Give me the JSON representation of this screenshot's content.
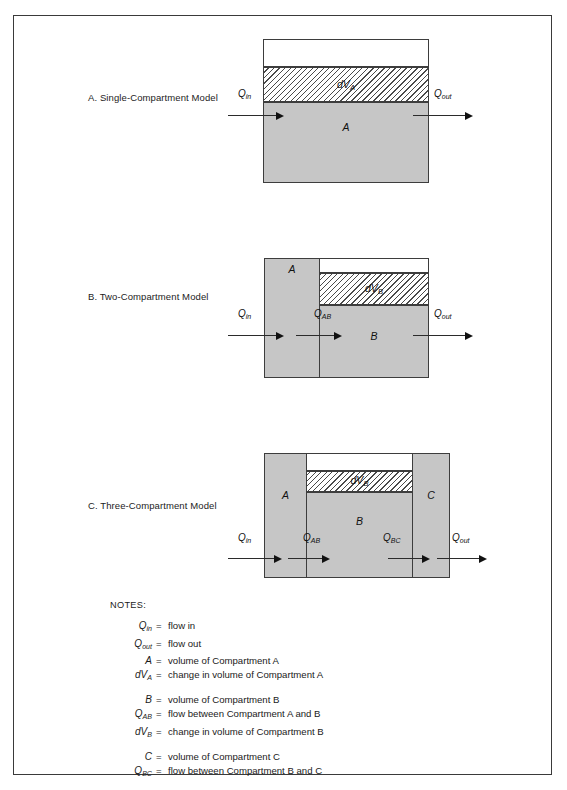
{
  "figures": [
    {
      "id": "single-compartment",
      "title": "A. Single-Compartment Model",
      "labels": {
        "compartment_a": "A",
        "dva": "dVA",
        "dva_base": "dV",
        "dva_sub": "A"
      },
      "flows": [
        {
          "name": "q-in",
          "base": "Q",
          "sub": "in"
        },
        {
          "name": "q-out",
          "base": "Q",
          "sub": "out"
        }
      ]
    },
    {
      "id": "two-compartment",
      "title": "B. Two-Compartment Model",
      "labels": {
        "compartment_a": "A",
        "compartment_b": "B",
        "dvb": "dVB",
        "dvb_base": "dV",
        "dvb_sub": "B"
      },
      "flows": [
        {
          "name": "q-in",
          "base": "Q",
          "sub": "in"
        },
        {
          "name": "q-ab",
          "base": "Q",
          "sub": "AB"
        },
        {
          "name": "q-out",
          "base": "Q",
          "sub": "out"
        }
      ]
    },
    {
      "id": "three-compartment",
      "title": "C. Three-Compartment Model",
      "labels": {
        "compartment_a": "A",
        "compartment_b": "B",
        "compartment_c": "C",
        "dvb": "dVB",
        "dvb_base": "dV",
        "dvb_sub": "B"
      },
      "flows": [
        {
          "name": "q-in",
          "base": "Q",
          "sub": "in"
        },
        {
          "name": "q-ab",
          "base": "Q",
          "sub": "AB"
        },
        {
          "name": "q-bc",
          "base": "Q",
          "sub": "BC"
        },
        {
          "name": "q-out",
          "base": "Q",
          "sub": "out"
        }
      ]
    }
  ],
  "notes": {
    "heading": "NOTES:",
    "equals": "=",
    "groups": [
      [
        {
          "base": "Q",
          "sub": "in",
          "text": "flow in"
        },
        {
          "base": "Q",
          "sub": "out",
          "text": "flow out"
        },
        {
          "base": "A",
          "sub": "",
          "text": "volume of Compartment A"
        },
        {
          "base": "dV",
          "sub": "A",
          "text": "change in volume of Compartment A"
        }
      ],
      [
        {
          "base": "B",
          "sub": "",
          "text": "volume of Compartment B"
        },
        {
          "base": "Q",
          "sub": "AB",
          "text": "flow between Compartment A and B"
        },
        {
          "base": "dV",
          "sub": "B",
          "text": "change in volume of Compartment B"
        }
      ],
      [
        {
          "base": "C",
          "sub": "",
          "text": "volume of Compartment C"
        },
        {
          "base": "Q",
          "sub": "BC",
          "text": "flow between Compartment B and C"
        }
      ]
    ]
  },
  "colors": {
    "fill_gray": "#c6c6c6",
    "stroke": "#3d3d3d",
    "frame": "#3a3a3a",
    "text": "#1a1a1a",
    "page": "#ffffff"
  }
}
